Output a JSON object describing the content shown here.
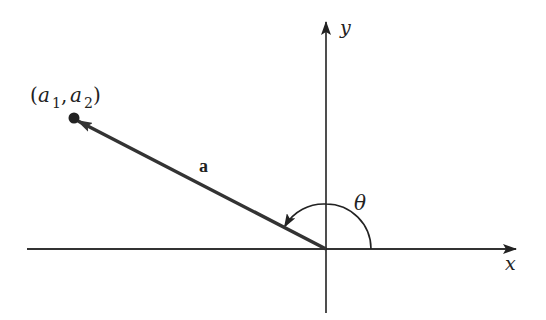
{
  "diagram": {
    "type": "vector-angle-diagram",
    "axes": {
      "x_label": "x",
      "y_label": "y"
    },
    "vector": {
      "label": "a",
      "endpoint_label": {
        "open": "(",
        "a": "a",
        "sub1": "1",
        "comma": ", ",
        "a2": "a",
        "sub2": "2",
        "close": ")"
      }
    },
    "angle": {
      "label": "θ"
    },
    "colors": {
      "stroke": "#222222",
      "vector": "#333333",
      "background": "#ffffff"
    }
  }
}
